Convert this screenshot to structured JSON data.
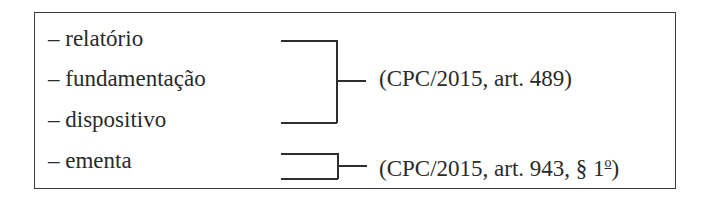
{
  "items": [
    {
      "dash": "–",
      "label": "relatório"
    },
    {
      "dash": "–",
      "label": "fundamentação"
    },
    {
      "dash": "–",
      "label": "dispositivo"
    },
    {
      "dash": "–",
      "label": "ementa"
    }
  ],
  "references": [
    {
      "text": "(CPC/2015, art. 489)",
      "groups": [
        "relatório",
        "fundamentação",
        "dispositivo"
      ]
    },
    {
      "text": "(CPC/2015, art. 943, § 1",
      "ordinal": "o",
      "close": ")",
      "groups": [
        "ementa"
      ]
    }
  ]
}
